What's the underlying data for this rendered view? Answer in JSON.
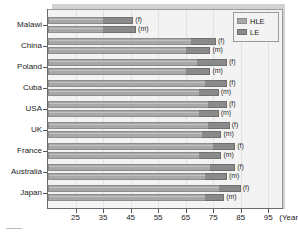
{
  "chart_data": {
    "type": "bar",
    "orientation": "horizontal",
    "stacked": true,
    "title": "",
    "xlabel": "(Years)",
    "ylabel": "",
    "xlim": [
      15,
      100
    ],
    "xticks": [
      25,
      35,
      45,
      55,
      65,
      75,
      85,
      95
    ],
    "xticklabels": [
      "25",
      "35",
      "45",
      "55",
      "65",
      "75",
      "85",
      "95"
    ],
    "grid": true,
    "legend_position": "top-right",
    "legend": [
      {
        "name": "HLE",
        "color": "#a8a8a8"
      },
      {
        "name": "LE",
        "color": "#8a8a8a"
      }
    ],
    "categories": [
      "Malawi",
      "China",
      "Poland",
      "Cuba",
      "USA",
      "UK",
      "France",
      "Australia",
      "Japan"
    ],
    "sex_labels": [
      "(f)",
      "(m)"
    ],
    "series": [
      {
        "name": "HLE",
        "color": "#a8a8a8"
      },
      {
        "name": "LE",
        "color": "#8a8a8a"
      }
    ],
    "bars": [
      {
        "category": "Malawi",
        "sex": "(f)",
        "hle": 35,
        "le": 46
      },
      {
        "category": "Malawi",
        "sex": "(m)",
        "hle": 35,
        "le": 47
      },
      {
        "category": "China",
        "sex": "(f)",
        "hle": 67,
        "le": 76
      },
      {
        "category": "China",
        "sex": "(m)",
        "hle": 65,
        "le": 74
      },
      {
        "category": "Poland",
        "sex": "(f)",
        "hle": 69,
        "le": 80
      },
      {
        "category": "Poland",
        "sex": "(m)",
        "hle": 65,
        "le": 74
      },
      {
        "category": "Cuba",
        "sex": "(f)",
        "hle": 72,
        "le": 80
      },
      {
        "category": "Cuba",
        "sex": "(m)",
        "hle": 70,
        "le": 77
      },
      {
        "category": "USA",
        "sex": "(f)",
        "hle": 73,
        "le": 80
      },
      {
        "category": "USA",
        "sex": "(m)",
        "hle": 70,
        "le": 77
      },
      {
        "category": "UK",
        "sex": "(f)",
        "hle": 73,
        "le": 81
      },
      {
        "category": "UK",
        "sex": "(m)",
        "hle": 71,
        "le": 78
      },
      {
        "category": "France",
        "sex": "(f)",
        "hle": 75,
        "le": 83
      },
      {
        "category": "France",
        "sex": "(m)",
        "hle": 70,
        "le": 78
      },
      {
        "category": "Australia",
        "sex": "(f)",
        "hle": 74,
        "le": 83
      },
      {
        "category": "Australia",
        "sex": "(m)",
        "hle": 72,
        "le": 80
      },
      {
        "category": "Japan",
        "sex": "(f)",
        "hle": 77,
        "le": 85
      },
      {
        "category": "Japan",
        "sex": "(m)",
        "hle": 72,
        "le": 79
      }
    ]
  }
}
